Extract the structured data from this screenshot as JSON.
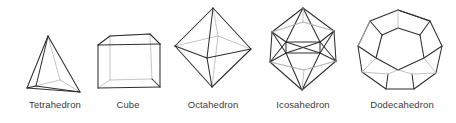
{
  "figure": {
    "background_color": "#ffffff",
    "line_color": "#2e2e2e",
    "hidden_line_color": "#b9b9b9",
    "label_color": "#3a3a3a"
  },
  "solids": [
    {
      "id": "tetrahedron",
      "label": "Tetrahedron",
      "faces": "4",
      "vertices": "4",
      "edges": "6"
    },
    {
      "id": "cube",
      "label": "Cube",
      "faces": "6",
      "vertices": "8",
      "edges": "12"
    },
    {
      "id": "octahedron",
      "label": "Octahedron",
      "faces": "8",
      "vertices": "6",
      "edges": "12"
    },
    {
      "id": "icosahedron",
      "label": "Icosahedron",
      "faces": "20",
      "vertices": "12",
      "edges": "30"
    },
    {
      "id": "dodecahedron",
      "label": "Dodecahedron",
      "faces": "12",
      "vertices": "20",
      "edges": "30"
    }
  ]
}
